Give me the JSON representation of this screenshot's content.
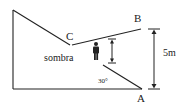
{
  "diagram": {
    "labels": {
      "point_a": "A",
      "point_b": "B",
      "point_c": "C",
      "shadow": "sombra",
      "angle": "30°",
      "height": "5m"
    },
    "colors": {
      "line": "#222222",
      "background": "#ffffff"
    },
    "icons": {
      "person": "person-silhouette-icon",
      "height_arrow": "double-arrow-vertical-icon"
    }
  }
}
